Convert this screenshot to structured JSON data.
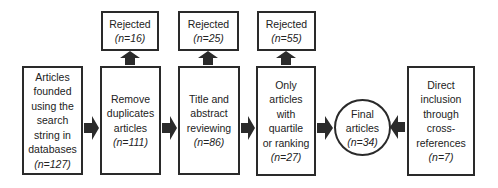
{
  "flow": {
    "steps": [
      {
        "lines": [
          "Articles",
          "founded",
          "using the",
          "search",
          "string in",
          "databases"
        ],
        "count": "(n=127)"
      },
      {
        "lines": [
          "Remove",
          "duplicates",
          "articles"
        ],
        "count": "(n=111)"
      },
      {
        "lines": [
          "Title and",
          "abstract",
          "reviewing"
        ],
        "count": "(n=86)"
      },
      {
        "lines": [
          "Only",
          "articles",
          "with",
          "quartile",
          "or ranking"
        ],
        "count": "(n=27)"
      }
    ],
    "rejected": [
      {
        "label": "Rejected",
        "count": "(n=16)"
      },
      {
        "label": "Rejected",
        "count": "(n=25)"
      },
      {
        "label": "Rejected",
        "count": "(n=55)"
      }
    ],
    "final": {
      "lines": [
        "Final",
        "articles"
      ],
      "count": "(n=34)"
    },
    "direct": {
      "lines": [
        "Direct",
        "inclusion",
        "through",
        "cross-",
        "references"
      ],
      "count": "(n=7)"
    }
  },
  "colors": {
    "border": "#2a2a2a",
    "arrow": "#2b2b2b",
    "background": "#ffffff"
  }
}
